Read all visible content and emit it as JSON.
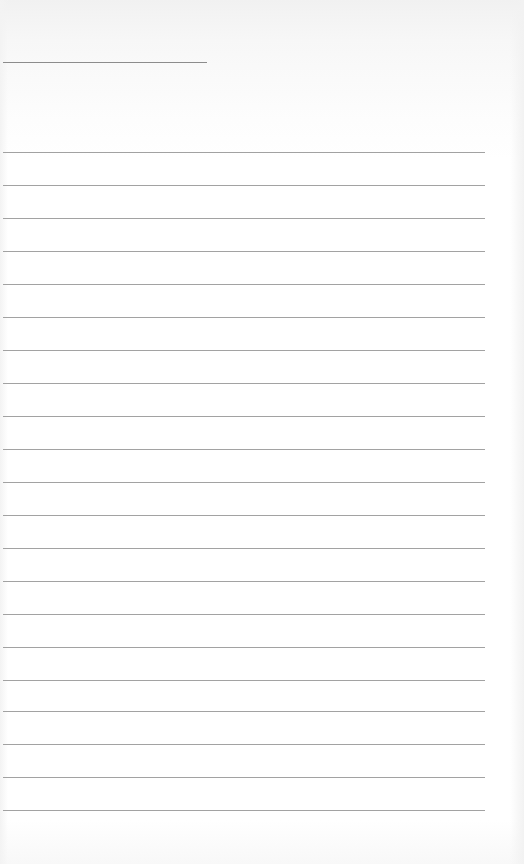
{
  "page": {
    "type": "blank lined paper",
    "header_rule": {
      "y": 62,
      "x_start": 3,
      "x_end": 207
    },
    "rules": {
      "x_start": 3,
      "x_end": 485,
      "y_positions": [
        152,
        185,
        218,
        251,
        284,
        317,
        350,
        383,
        416,
        449,
        482,
        515,
        548,
        581,
        614,
        647,
        680,
        711,
        744,
        777,
        810
      ]
    },
    "colors": {
      "paper": "#ffffff",
      "rule": "#a2a2a2",
      "header_rule": "#8c8c8c"
    }
  }
}
